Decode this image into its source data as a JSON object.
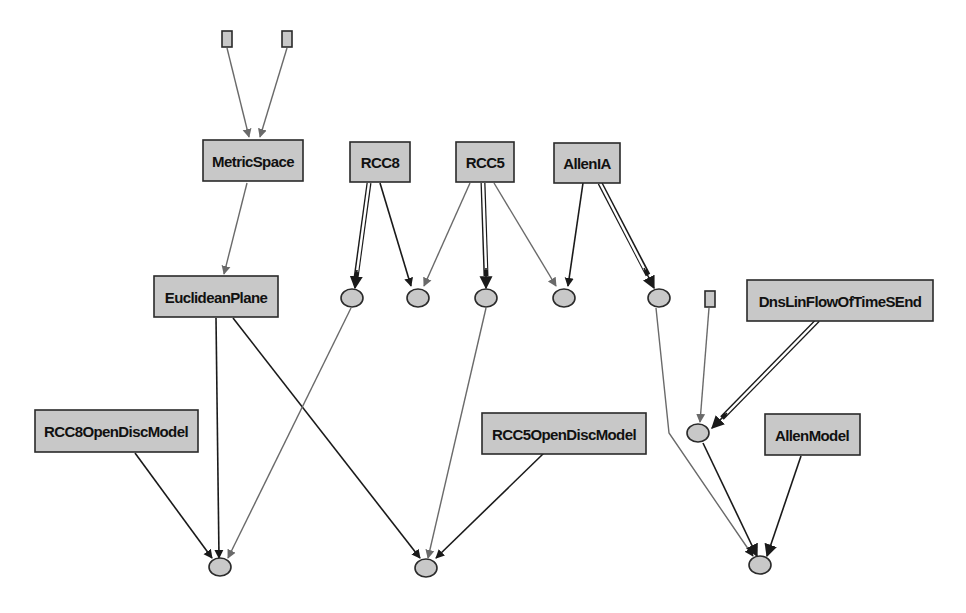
{
  "diagram": {
    "title": "",
    "nodes": {
      "metricspace": {
        "label": "MetricSpace"
      },
      "rcc8": {
        "label": "RCC8"
      },
      "rcc5": {
        "label": "RCC5"
      },
      "allenia": {
        "label": "AllenIA"
      },
      "euclideanplane": {
        "label": "EuclideanPlane"
      },
      "dnslinflow": {
        "label": "DnsLinFlowOfTimeSEnd"
      },
      "rcc8opendisc": {
        "label": "RCC8OpenDiscModel"
      },
      "rcc5opendisc": {
        "label": "RCC5OpenDiscModel"
      },
      "allenmodel": {
        "label": "AllenModel"
      }
    },
    "edges": [
      {
        "from": "small-box-1",
        "to": "MetricSpace",
        "style": "gray"
      },
      {
        "from": "small-box-2",
        "to": "MetricSpace",
        "style": "gray"
      },
      {
        "from": "MetricSpace",
        "to": "EuclideanPlane",
        "style": "gray"
      },
      {
        "from": "RCC8",
        "to": "ellipse-1",
        "style": "double"
      },
      {
        "from": "RCC8",
        "to": "ellipse-2",
        "style": "black"
      },
      {
        "from": "RCC5",
        "to": "ellipse-2",
        "style": "gray"
      },
      {
        "from": "RCC5",
        "to": "ellipse-3",
        "style": "double"
      },
      {
        "from": "RCC5",
        "to": "ellipse-4",
        "style": "gray"
      },
      {
        "from": "AllenIA",
        "to": "ellipse-4",
        "style": "black"
      },
      {
        "from": "AllenIA",
        "to": "ellipse-5",
        "style": "double"
      },
      {
        "from": "small-box-3",
        "to": "ellipse-6",
        "style": "gray"
      },
      {
        "from": "DnsLinFlowOfTimeSEnd",
        "to": "ellipse-6",
        "style": "double"
      },
      {
        "from": "EuclideanPlane",
        "to": "ellipse-bottom-1",
        "style": "black"
      },
      {
        "from": "EuclideanPlane",
        "to": "ellipse-bottom-2",
        "style": "black"
      },
      {
        "from": "RCC8OpenDiscModel",
        "to": "ellipse-bottom-1",
        "style": "black"
      },
      {
        "from": "ellipse-1",
        "to": "ellipse-bottom-1",
        "style": "gray"
      },
      {
        "from": "ellipse-3",
        "to": "ellipse-bottom-2",
        "style": "gray"
      },
      {
        "from": "RCC5OpenDiscModel",
        "to": "ellipse-bottom-2",
        "style": "black"
      },
      {
        "from": "ellipse-5",
        "to": "ellipse-bottom-3",
        "style": "gray"
      },
      {
        "from": "ellipse-6",
        "to": "ellipse-bottom-3",
        "style": "black"
      },
      {
        "from": "AllenModel",
        "to": "ellipse-bottom-3",
        "style": "black"
      }
    ],
    "colors": {
      "node_fill": "#c8c8c8",
      "node_stroke": "#2a2a2a",
      "edge_black": "#1a1a1a",
      "edge_gray": "#6a6a6a"
    }
  }
}
